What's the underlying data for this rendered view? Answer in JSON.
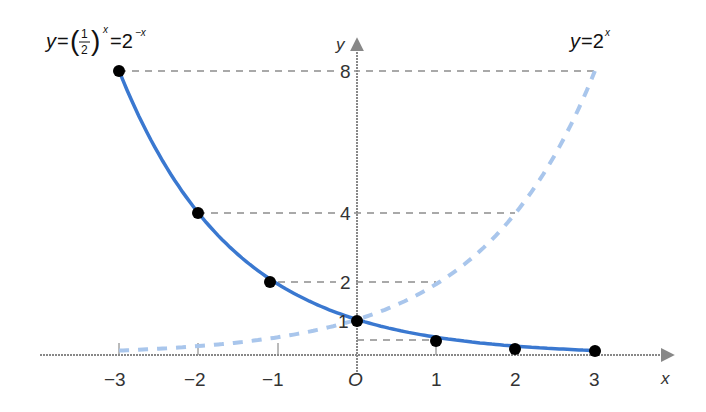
{
  "chart_data": {
    "type": "line",
    "title": "",
    "xlabel": "x",
    "ylabel": "y",
    "origin_label": "O",
    "xlim": [
      -3.5,
      3.8
    ],
    "ylim": [
      0,
      8.5
    ],
    "grid": false,
    "x_ticks": [
      "-3",
      "-2",
      "-1",
      "O",
      "1",
      "2",
      "3"
    ],
    "x_tick_values": [
      -3,
      -2,
      -1,
      0,
      1,
      2,
      3
    ],
    "y_ticks": [
      "1",
      "2",
      "4",
      "8"
    ],
    "y_tick_values": [
      1,
      2,
      4,
      8
    ],
    "series": [
      {
        "name": "y=(1/2)^x=2^-x",
        "label_main": "y=",
        "label_frac_num": "1",
        "label_frac_den": "2",
        "label_exp": "x",
        "label_eq2": "=2",
        "label_exp2": "−x",
        "style": "solid",
        "color": "#3a78d0",
        "x": [
          -3,
          -2,
          -1,
          0,
          1,
          2,
          3
        ],
        "y": [
          8,
          4,
          2,
          1,
          0.5,
          0.25,
          0.125
        ],
        "markers": true
      },
      {
        "name": "y=2^x",
        "label_main": "y=2",
        "label_exp": "x",
        "style": "dashed",
        "color": "#a9c6ec",
        "x": [
          -3,
          -2,
          -1,
          0,
          1,
          2,
          3
        ],
        "y": [
          0.125,
          0.25,
          0.5,
          1,
          2,
          4,
          8
        ],
        "markers": false
      }
    ],
    "reference_lines": [
      {
        "y": 8,
        "from_x": -3,
        "to_x": 3
      },
      {
        "y": 4,
        "from_x": -2,
        "to_x": 2
      },
      {
        "y": 2,
        "from_x": -1,
        "to_x": 1
      },
      {
        "y": 0.5,
        "from_x": 0,
        "to_x": 1
      }
    ]
  },
  "labels": {
    "x_axis": "x",
    "y_axis": "y",
    "origin": "O",
    "xt_m3": "−3",
    "xt_m2": "−2",
    "xt_m1": "−1",
    "xt_1": "1",
    "xt_2": "2",
    "xt_3": "3",
    "yt_1": "1",
    "yt_2": "2",
    "yt_4": "4",
    "yt_8": "8",
    "left_eq_y": "y",
    "left_eq_eq": "=",
    "left_eq_num": "1",
    "left_eq_den": "2",
    "left_eq_exp": "x",
    "left_eq_eq2": "=2",
    "left_eq_exp2": "−x",
    "right_eq_y": "y",
    "right_eq_eq": "=2",
    "right_eq_exp": "x"
  }
}
